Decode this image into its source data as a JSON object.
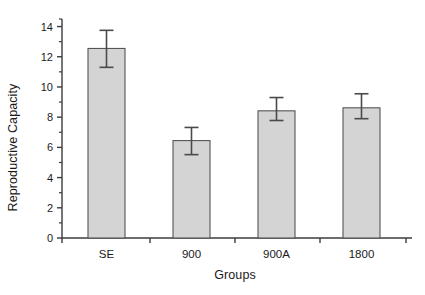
{
  "chart_data": {
    "type": "bar",
    "title": "",
    "xlabel": "Groups",
    "ylabel": "Reproductive Capacity",
    "categories": [
      "SE",
      "900",
      "900A",
      "1800"
    ],
    "values": [
      12.55,
      6.45,
      8.42,
      8.62
    ],
    "errors": [
      1.25,
      0.9,
      0.75,
      0.8
    ],
    "error_upper": [
      13.75,
      7.32,
      9.3,
      9.55
    ],
    "error_lower": [
      11.3,
      5.52,
      7.78,
      7.9
    ],
    "ylim": [
      0,
      14.5
    ],
    "yticks": [
      0,
      2,
      4,
      6,
      8,
      10,
      12,
      14
    ],
    "ytick_labels": [
      "0",
      "2",
      "4",
      "6",
      "8",
      "10",
      "12",
      "14"
    ],
    "minor_yticks": [
      1,
      3,
      5,
      7,
      9,
      11,
      13,
      14.5
    ],
    "grid": false,
    "legend": null,
    "bar_fill_color": "#d4d4d4",
    "bar_edge_color": "#555555",
    "axis_color": "#3c3c3c",
    "error_bar_color": "#4a4a4a"
  },
  "axis": {
    "y_title": "Reproductive Capacity",
    "x_title": "Groups"
  }
}
